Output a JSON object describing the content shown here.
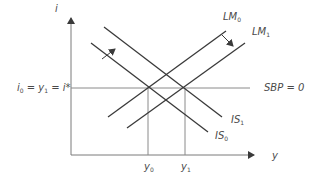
{
  "diagram": {
    "type": "IS-LM-BP",
    "axes": {
      "y_axis_label": "i",
      "x_axis_label": "y"
    },
    "horizontal_line": {
      "label_left": "i0 = y1 = i*",
      "label_left_parts": [
        "i",
        "0",
        " = y",
        "1",
        " = i*"
      ],
      "label_right": "SBP = 0"
    },
    "curves": [
      {
        "name": "LM0",
        "base": "LM",
        "sub": "0"
      },
      {
        "name": "LM1",
        "base": "LM",
        "sub": "1"
      },
      {
        "name": "IS1",
        "base": "IS",
        "sub": "1"
      },
      {
        "name": "IS0",
        "base": "IS",
        "sub": "0"
      }
    ],
    "x_ticks": [
      {
        "base": "y",
        "sub": "0"
      },
      {
        "base": "y",
        "sub": "1"
      }
    ],
    "colors": {
      "lines": "#3a3a3a",
      "axes": "#7a7a7a",
      "text": "#4a4a4a"
    }
  }
}
